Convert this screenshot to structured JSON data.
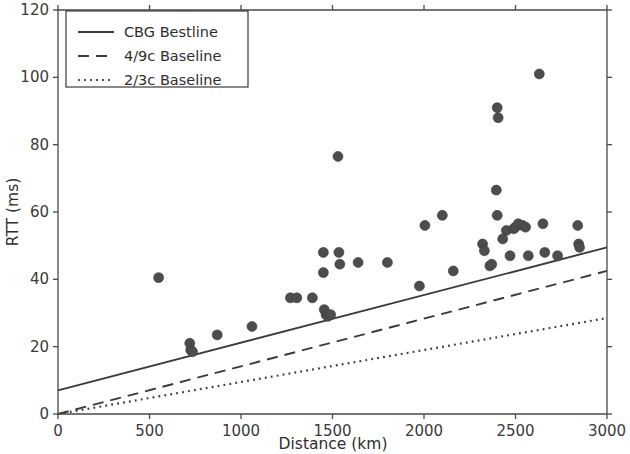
{
  "chart_data": {
    "type": "scatter",
    "title": "",
    "xlabel": "Distance (km)",
    "ylabel": "RTT (ms)",
    "xlim": [
      0,
      3000
    ],
    "ylim": [
      0,
      120
    ],
    "xticks": [
      0,
      500,
      1000,
      1500,
      2000,
      2500,
      3000
    ],
    "yticks": [
      0,
      20,
      40,
      60,
      80,
      100,
      120
    ],
    "xtick_labels": [
      "0",
      "500",
      "1000",
      "1500",
      "2000",
      "2500",
      "3000"
    ],
    "ytick_labels": [
      "0",
      "20",
      "40",
      "60",
      "80",
      "100",
      "120"
    ],
    "grid": false,
    "legend_position": "upper left",
    "marker_color": "#4d4d4d",
    "line_color": "#3b3b3b",
    "scatter": {
      "name": "Measurements",
      "points": [
        [
          550,
          40.5
        ],
        [
          720,
          21.0
        ],
        [
          725,
          19.0
        ],
        [
          735,
          18.5
        ],
        [
          870,
          23.5
        ],
        [
          1060,
          26.0
        ],
        [
          1270,
          34.5
        ],
        [
          1305,
          34.5
        ],
        [
          1390,
          34.5
        ],
        [
          1455,
          31.0
        ],
        [
          1465,
          29.5
        ],
        [
          1475,
          29.0
        ],
        [
          1490,
          29.5
        ],
        [
          1450,
          48.0
        ],
        [
          1450,
          42.0
        ],
        [
          1530,
          76.5
        ],
        [
          1535,
          48.0
        ],
        [
          1540,
          44.5
        ],
        [
          1640,
          45.0
        ],
        [
          1800,
          45.0
        ],
        [
          1975,
          38.0
        ],
        [
          2005,
          56.0
        ],
        [
          2100,
          59.0
        ],
        [
          2160,
          42.5
        ],
        [
          2320,
          50.5
        ],
        [
          2330,
          48.5
        ],
        [
          2360,
          44.0
        ],
        [
          2370,
          44.5
        ],
        [
          2395,
          66.5
        ],
        [
          2400,
          59.0
        ],
        [
          2400,
          91.0
        ],
        [
          2405,
          88.0
        ],
        [
          2430,
          52.0
        ],
        [
          2450,
          54.5
        ],
        [
          2470,
          47.0
        ],
        [
          2490,
          55.0
        ],
        [
          2500,
          55.5
        ],
        [
          2515,
          56.5
        ],
        [
          2540,
          56.0
        ],
        [
          2555,
          55.5
        ],
        [
          2570,
          47.0
        ],
        [
          2630,
          101.0
        ],
        [
          2650,
          56.5
        ],
        [
          2660,
          48.0
        ],
        [
          2730,
          47.0
        ],
        [
          2840,
          56.0
        ],
        [
          2845,
          50.5
        ],
        [
          2850,
          49.5
        ]
      ]
    },
    "series": [
      {
        "name": "CBG Bestline",
        "style": "solid",
        "x": [
          0,
          3000
        ],
        "y": [
          7.0,
          49.5
        ]
      },
      {
        "name": "4/9c Baseline",
        "style": "dashed",
        "x": [
          0,
          3000
        ],
        "y": [
          0.0,
          42.5
        ]
      },
      {
        "name": "2/3c Baseline",
        "style": "dotted",
        "x": [
          0,
          3000
        ],
        "y": [
          0.0,
          28.5
        ]
      }
    ],
    "legend_entries": [
      {
        "label": "CBG Bestline",
        "style": "solid"
      },
      {
        "label": "4/9c Baseline",
        "style": "dashed"
      },
      {
        "label": "2/3c Baseline",
        "style": "dotted"
      }
    ]
  }
}
